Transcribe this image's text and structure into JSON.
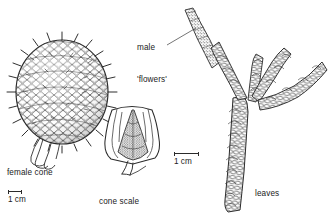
{
  "figure": {
    "background_color": "#ffffff",
    "ink_color": "#2b2b2b",
    "text_color": "#222222",
    "width": 329,
    "height": 216
  },
  "labels": {
    "female_cone": "female cone",
    "cone_scale_line1": "cone scale",
    "cone_scale_line2": "with  seed",
    "male_flowers_line1": "male",
    "male_flowers_line2": "'flowers'",
    "leaves": "leaves"
  },
  "scalebars": [
    {
      "id": "left",
      "caption": "1 cm",
      "length_px": 14
    },
    {
      "id": "right",
      "caption": "1 cm",
      "length_px": 25
    }
  ],
  "illustrations": [
    {
      "name": "female-cone-drawing",
      "description": "ovoid spiny seed cone with rhombic scales on short stalk"
    },
    {
      "name": "cone-scale-with-seed-drawing",
      "description": "fan shaped cone scale bearing a stippled triangular winged seed"
    },
    {
      "name": "male-flowers-drawing",
      "description": "elongate stippled male pollen catkin at branch tip"
    },
    {
      "name": "leafy-branch-drawing",
      "description": "branched shoot clothed in overlapping scale leaves"
    }
  ]
}
